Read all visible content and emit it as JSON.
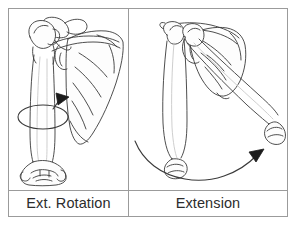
{
  "figure": {
    "frame_color": "#9b9b9b",
    "background_color": "#ffffff",
    "line_color": "#3a3a3a",
    "text_color": "#2c2c2c",
    "panel_count": 2
  },
  "panels": [
    {
      "id": "ext-rotation",
      "label": "Ext. Rotation",
      "illustration_name": "humerus-scapula-anterior-with-rotation-arrow",
      "bones": [
        "humerus",
        "scapula"
      ],
      "arrow": {
        "name": "rotation-arrow",
        "type": "elliptical-rotation",
        "direction": "counterclockwise-outward",
        "filled_head": true
      }
    },
    {
      "id": "extension",
      "label": "Extension",
      "illustration_name": "humerus-scapula-lateral-with-extension-arc-arrow",
      "bones": [
        "humerus-neutral",
        "humerus-extended",
        "scapula"
      ],
      "arrow": {
        "name": "extension-arrow",
        "type": "arc-sweep",
        "direction": "left-to-right-posterior",
        "filled_head": true
      }
    }
  ]
}
